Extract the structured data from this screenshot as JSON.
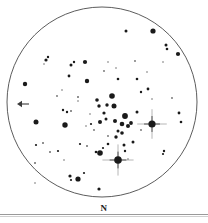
{
  "figure": {
    "kind": "telescope-eyepiece-sketch",
    "north_label": "N",
    "direction_arrow": {
      "name": "west-direction-arrow",
      "points": "left",
      "x_tail": 29,
      "x_head": 17,
      "y": 104
    },
    "field_of_view": {
      "center_x": 102,
      "center_y": 102,
      "radius": 95,
      "stroke_color": "#4a4a4a",
      "fill_color": "#ffffff"
    },
    "colors": {
      "star": "#1a1a1a",
      "star_faint": "#6d6d6d",
      "outline": "#4a4a4a",
      "rule": "#9a9a9a",
      "background": "#ffffff"
    }
  },
  "chart_data": {
    "type": "scatter",
    "title": "",
    "xlabel": "",
    "ylabel": "",
    "xlim": [
      0,
      208
    ],
    "ylim": [
      0,
      223
    ],
    "grid": false,
    "legend": null,
    "annotations": [
      {
        "text": "N",
        "x": 99,
        "y": 211
      }
    ],
    "series": [
      {
        "name": "stars",
        "description": "Star field inside circular eyepiece field of view; r = apparent magnitude radius in px, spikes = bright star diffraction spikes",
        "points": [
          {
            "x": 152,
            "y": 124,
            "r": 3.6,
            "spikes": true
          },
          {
            "x": 118,
            "y": 160,
            "r": 3.8,
            "spikes": true
          },
          {
            "x": 153,
            "y": 31,
            "r": 2.6,
            "spikes": false
          },
          {
            "x": 125,
            "y": 116,
            "r": 2.9,
            "spikes": false
          },
          {
            "x": 112,
            "y": 96,
            "r": 2.8,
            "spikes": false
          },
          {
            "x": 114,
            "y": 106,
            "r": 2.5,
            "spikes": false
          },
          {
            "x": 100,
            "y": 153,
            "r": 2.8,
            "spikes": false
          },
          {
            "x": 65,
            "y": 125,
            "r": 2.7,
            "spikes": false
          },
          {
            "x": 36,
            "y": 122,
            "r": 2.5,
            "spikes": false
          },
          {
            "x": 78,
            "y": 179,
            "r": 2.6,
            "spikes": false
          },
          {
            "x": 25,
            "y": 84,
            "r": 2.2,
            "spikes": false
          },
          {
            "x": 87,
            "y": 81,
            "r": 2.2,
            "spikes": false
          },
          {
            "x": 178,
            "y": 54,
            "r": 2.1,
            "spikes": false
          },
          {
            "x": 166,
            "y": 45,
            "r": 1.5,
            "spikes": false
          },
          {
            "x": 167,
            "y": 49,
            "r": 1.3,
            "spikes": false
          },
          {
            "x": 126,
            "y": 31,
            "r": 1.5,
            "spikes": false
          },
          {
            "x": 85,
            "y": 62,
            "r": 2.1,
            "spikes": false
          },
          {
            "x": 100,
            "y": 122,
            "r": 2.0,
            "spikes": false
          },
          {
            "x": 115,
            "y": 121,
            "r": 2.0,
            "spikes": false
          },
          {
            "x": 122,
            "y": 124,
            "r": 2.3,
            "spikes": false
          },
          {
            "x": 128,
            "y": 126,
            "r": 2.0,
            "spikes": false
          },
          {
            "x": 131,
            "y": 123,
            "r": 1.9,
            "spikes": false
          },
          {
            "x": 122,
            "y": 133,
            "r": 1.8,
            "spikes": false
          },
          {
            "x": 116,
            "y": 137,
            "r": 1.7,
            "spikes": false
          },
          {
            "x": 107,
            "y": 105,
            "r": 1.7,
            "spikes": false
          },
          {
            "x": 104,
            "y": 113,
            "r": 1.6,
            "spikes": false
          },
          {
            "x": 97,
            "y": 100,
            "r": 1.8,
            "spikes": false
          },
          {
            "x": 99,
            "y": 106,
            "r": 1.7,
            "spikes": false
          },
          {
            "x": 106,
            "y": 119,
            "r": 1.5,
            "spikes": false
          },
          {
            "x": 46,
            "y": 60,
            "r": 1.6,
            "spikes": false
          },
          {
            "x": 48,
            "y": 57,
            "r": 1.2,
            "spikes": false
          },
          {
            "x": 71,
            "y": 65,
            "r": 1.5,
            "spikes": false
          },
          {
            "x": 74,
            "y": 62,
            "r": 1.2,
            "spikes": false
          },
          {
            "x": 69,
            "y": 76,
            "r": 1.4,
            "spikes": false
          },
          {
            "x": 118,
            "y": 79,
            "r": 1.3,
            "spikes": false
          },
          {
            "x": 137,
            "y": 79,
            "r": 1.3,
            "spikes": false
          },
          {
            "x": 148,
            "y": 89,
            "r": 1.4,
            "spikes": false
          },
          {
            "x": 141,
            "y": 92,
            "r": 1.2,
            "spikes": false
          },
          {
            "x": 179,
            "y": 113,
            "r": 1.4,
            "spikes": false
          },
          {
            "x": 181,
            "y": 122,
            "r": 1.3,
            "spikes": false
          },
          {
            "x": 164,
            "y": 151,
            "r": 1.2,
            "spikes": false
          },
          {
            "x": 133,
            "y": 142,
            "r": 1.5,
            "spikes": false
          },
          {
            "x": 124,
            "y": 145,
            "r": 1.5,
            "spikes": false
          },
          {
            "x": 137,
            "y": 112,
            "r": 1.5,
            "spikes": false
          },
          {
            "x": 118,
            "y": 131,
            "r": 1.5,
            "spikes": false
          },
          {
            "x": 78,
            "y": 97,
            "r": 1.0,
            "spikes": false
          },
          {
            "x": 63,
            "y": 110,
            "r": 1.2,
            "spikes": false
          },
          {
            "x": 67,
            "y": 112,
            "r": 1.2,
            "spikes": false
          },
          {
            "x": 71,
            "y": 111,
            "r": 1.0,
            "spikes": false
          },
          {
            "x": 91,
            "y": 124,
            "r": 1.1,
            "spikes": false
          },
          {
            "x": 80,
            "y": 144,
            "r": 1.1,
            "spikes": false
          },
          {
            "x": 87,
            "y": 146,
            "r": 1.0,
            "spikes": false
          },
          {
            "x": 36,
            "y": 145,
            "r": 1.1,
            "spikes": false
          },
          {
            "x": 50,
            "y": 152,
            "r": 1.0,
            "spikes": false
          },
          {
            "x": 58,
            "y": 151,
            "r": 1.1,
            "spikes": false
          },
          {
            "x": 35,
            "y": 163,
            "r": 1.0,
            "spikes": false
          },
          {
            "x": 70,
            "y": 176,
            "r": 1.6,
            "spikes": false
          },
          {
            "x": 71,
            "y": 180,
            "r": 1.1,
            "spikes": false
          },
          {
            "x": 84,
            "y": 173,
            "r": 1.1,
            "spikes": false
          },
          {
            "x": 99,
            "y": 189,
            "r": 1.6,
            "spikes": false
          },
          {
            "x": 108,
            "y": 144,
            "r": 1.3,
            "spikes": false
          },
          {
            "x": 125,
            "y": 151,
            "r": 1.2,
            "spikes": false
          },
          {
            "x": 96,
            "y": 152,
            "r": 1.3,
            "spikes": false
          },
          {
            "x": 103,
            "y": 148,
            "r": 1.1,
            "spikes": false
          },
          {
            "x": 163,
            "y": 154,
            "r": 1.1,
            "spikes": false
          },
          {
            "x": 43,
            "y": 143,
            "r": 1.0,
            "spikes": false
          },
          {
            "x": 57,
            "y": 96,
            "r": 0.9,
            "spikes": false
          },
          {
            "x": 78,
            "y": 101,
            "r": 0.8,
            "spikes": false
          },
          {
            "x": 94,
            "y": 130,
            "r": 0.9,
            "spikes": false
          },
          {
            "x": 141,
            "y": 130,
            "r": 0.9,
            "spikes": false
          },
          {
            "x": 172,
            "y": 98,
            "r": 0.9,
            "spikes": false
          },
          {
            "x": 163,
            "y": 62,
            "r": 0.8,
            "spikes": false
          },
          {
            "x": 135,
            "y": 61,
            "r": 0.9,
            "spikes": false
          },
          {
            "x": 104,
            "y": 71,
            "r": 0.9,
            "spikes": false
          },
          {
            "x": 44,
            "y": 64,
            "r": 0.8,
            "spikes": false
          },
          {
            "x": 62,
            "y": 90,
            "r": 0.8,
            "spikes": false
          },
          {
            "x": 147,
            "y": 72,
            "r": 0.8,
            "spikes": false
          },
          {
            "x": 108,
            "y": 62,
            "r": 0.8,
            "spikes": false
          },
          {
            "x": 90,
            "y": 114,
            "r": 0.8,
            "spikes": false
          },
          {
            "x": 86,
            "y": 126,
            "r": 0.8,
            "spikes": false
          },
          {
            "x": 128,
            "y": 159,
            "r": 0.8,
            "spikes": false
          },
          {
            "x": 152,
            "y": 99,
            "r": 0.8,
            "spikes": false
          },
          {
            "x": 64,
            "y": 160,
            "r": 0.8,
            "spikes": false
          },
          {
            "x": 35,
            "y": 183,
            "r": 0.8,
            "spikes": false
          },
          {
            "x": 108,
            "y": 136,
            "r": 0.9,
            "spikes": false
          },
          {
            "x": 116,
            "y": 68,
            "r": 0.8,
            "spikes": false
          }
        ]
      }
    ]
  }
}
